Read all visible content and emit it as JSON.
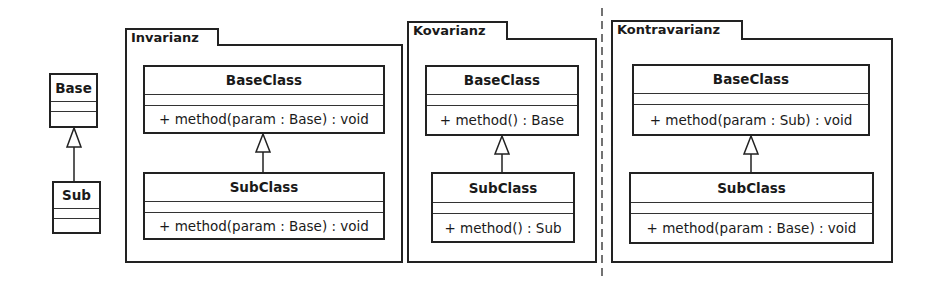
{
  "legend": {
    "base": {
      "name": "Base"
    },
    "sub": {
      "name": "Sub"
    }
  },
  "packages": [
    {
      "title": "Invarianz",
      "base": {
        "name": "BaseClass",
        "operation": "+ method(param : Base) : void"
      },
      "sub": {
        "name": "SubClass",
        "operation": "+ method(param : Base) : void"
      }
    },
    {
      "title": "Kovarianz",
      "base": {
        "name": "BaseClass",
        "operation": "+ method() : Base"
      },
      "sub": {
        "name": "SubClass",
        "operation": "+ method() : Sub"
      }
    },
    {
      "title": "Kontravarianz",
      "base": {
        "name": "BaseClass",
        "operation": "+ method(param : Sub) : void"
      },
      "sub": {
        "name": "SubClass",
        "operation": "+ method(param : Base) : void"
      }
    }
  ],
  "relationship": "generalization",
  "separator": "dashed-vertical"
}
